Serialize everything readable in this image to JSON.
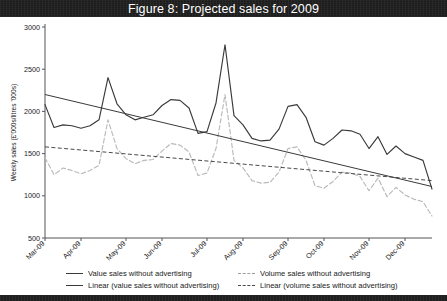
{
  "figure": {
    "title": "Figure 8: Projected sales for 2009"
  },
  "chart_data": {
    "type": "line",
    "title": "Figure 8: Projected sales for 2009",
    "xlabel": "",
    "ylabel": "Weekly sales (£'000s/litres '000s)",
    "ylim": [
      500,
      3000
    ],
    "ytick_step": 500,
    "ytick_labels": [
      "3000",
      "2500",
      "2000",
      "1500",
      "1000",
      "500"
    ],
    "ytick_values": [
      3000,
      2500,
      2000,
      1500,
      1000,
      500
    ],
    "grid": false,
    "legend_position": "bottom",
    "x_tick_labels": [
      "Mar-09",
      "Apr-09",
      "May-09",
      "Jun-09",
      "Jul-09",
      "Aug-09",
      "Sep-09",
      "Oct-09",
      "Nov-09",
      "Dec-09"
    ],
    "x_tick_index": [
      0,
      4,
      9,
      13,
      18,
      22,
      27,
      31,
      36,
      40
    ],
    "n_points": 44,
    "series": [
      {
        "name": "Value sales without advertising",
        "style": "solid",
        "color": "#3a3a3a",
        "values": [
          2080,
          1810,
          1840,
          1830,
          1800,
          1830,
          1900,
          2400,
          2090,
          1960,
          1900,
          1930,
          1960,
          2070,
          2140,
          2130,
          2040,
          1740,
          1760,
          2100,
          2790,
          1950,
          1840,
          1680,
          1650,
          1660,
          1790,
          2060,
          2080,
          1930,
          1640,
          1600,
          1680,
          1780,
          1770,
          1730,
          1560,
          1700,
          1490,
          1590,
          1500,
          1460,
          1420,
          1080
        ]
      },
      {
        "name": "Linear (value sales without advertising)",
        "style": "solid-trend",
        "color": "#3a3a3a",
        "values": [
          2200,
          1110
        ],
        "endpoints": {
          "start": 2200,
          "end": 1110
        }
      },
      {
        "name": "Volume sales without advertising",
        "style": "dashed",
        "color": "#b9b9b9",
        "values": [
          1450,
          1250,
          1330,
          1300,
          1260,
          1300,
          1360,
          1900,
          1560,
          1440,
          1380,
          1420,
          1430,
          1530,
          1620,
          1600,
          1520,
          1240,
          1270,
          1560,
          2200,
          1420,
          1330,
          1180,
          1150,
          1160,
          1280,
          1560,
          1580,
          1420,
          1120,
          1090,
          1170,
          1280,
          1270,
          1230,
          1060,
          1210,
          990,
          1100,
          1010,
          960,
          930,
          760
        ]
      },
      {
        "name": "Linear (volume sales without advertising)",
        "style": "dashed-trend",
        "color": "#4a4a4a",
        "values": [
          1580,
          1180
        ],
        "endpoints": {
          "start": 1580,
          "end": 1180
        }
      }
    ]
  },
  "legend": {
    "items": [
      {
        "label": "Value sales without advertising",
        "swatch": "solid-dark-line"
      },
      {
        "label": "Linear (value sales without advertising)",
        "swatch": "solid-dark-line"
      },
      {
        "label": "Volume sales without advertising",
        "swatch": "dashed-light-line"
      },
      {
        "label": "Linear (volume sales without advertising)",
        "swatch": "dashed-dark-line"
      }
    ]
  }
}
